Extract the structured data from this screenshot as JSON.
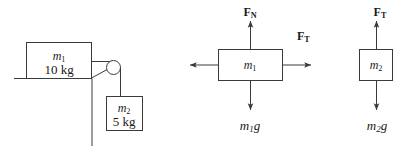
{
  "figure": {
    "stroke_color": "#3a3a3a",
    "text_color": "#1a1a1a",
    "background": "#ffffff"
  },
  "setup": {
    "name": "pulley-system",
    "block1": {
      "symbol": "m",
      "subscript": "1",
      "mass_value": "10 kg"
    },
    "block2": {
      "symbol": "m",
      "subscript": "2",
      "mass_value": "5 kg"
    },
    "pulley": "pulley-wheel",
    "table": "table-edge"
  },
  "fbd1": {
    "name": "free-body-diagram-block1",
    "body_symbol": "m",
    "body_subscript": "1",
    "normal_force": "F",
    "normal_force_sub": "N",
    "tension_force": "F",
    "tension_force_sub": "T",
    "weight": "m",
    "weight_sub": "1",
    "weight_g": "g",
    "arrows": [
      "arrow-up-normal",
      "arrow-right-tension",
      "arrow-left-unlabeled",
      "arrow-down-weight"
    ]
  },
  "fbd2": {
    "name": "free-body-diagram-block2",
    "body_symbol": "m",
    "body_subscript": "2",
    "tension_force": "F",
    "tension_force_sub": "T",
    "weight": "m",
    "weight_sub": "2",
    "weight_g": "g",
    "arrows": [
      "arrow-up-tension",
      "arrow-down-weight"
    ]
  }
}
